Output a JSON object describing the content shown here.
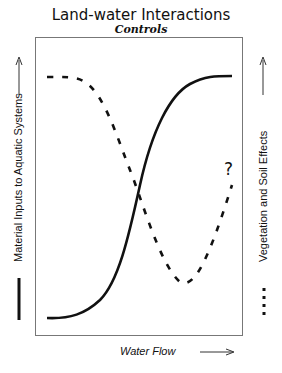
{
  "diagram": {
    "title": "Land-water Interactions",
    "subtitle": "Controls",
    "y_left_label": "Material Inputs to Aquatic Systems",
    "y_right_label": "Vegetation and Soil Effects",
    "x_label": "Water Flow",
    "annotation": "?",
    "legend": {
      "solid_line": "Material Inputs to Aquatic Systems",
      "dotted_line": "Vegetation and Soil Effects"
    },
    "colors": {
      "line": "#111111",
      "frame": "#777777"
    }
  }
}
